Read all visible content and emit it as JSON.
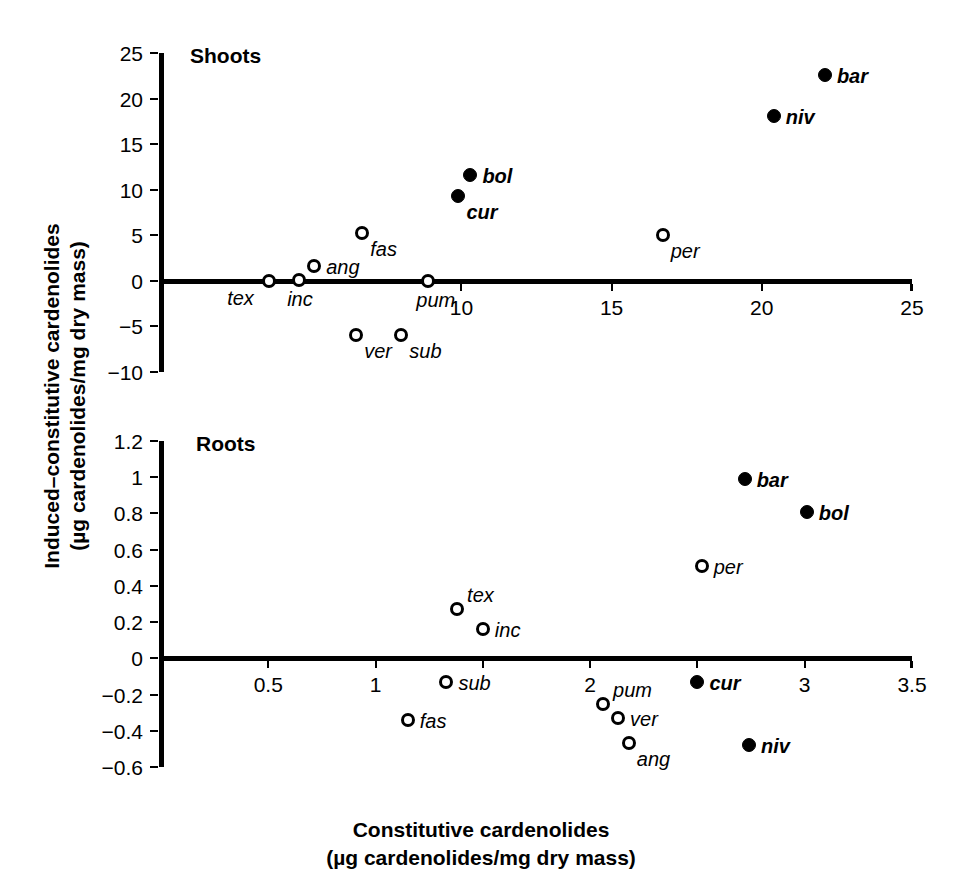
{
  "figure": {
    "xlabel_line1": "Constitutive cardenolides",
    "xlabel_line2": "(µg cardenolides/mg dry mass)",
    "ylabel_line1": "Induced–constitutive cardenolides",
    "ylabel_line2": "(µg cardenolides/mg dry mass)"
  },
  "chart_data": [
    {
      "type": "scatter",
      "title": "Shoots",
      "xlabel": "Constitutive cardenolides (µg cardenolides/mg dry mass)",
      "ylabel": "Induced–constitutive cardenolides (µg cardenolides/mg dry mass)",
      "xlim": [
        0,
        25
      ],
      "ylim": [
        -10,
        25
      ],
      "xticks": [
        10,
        15,
        20,
        25
      ],
      "xticklabels": [
        "10",
        "15",
        "20",
        "25"
      ],
      "yticks": [
        -10,
        -5,
        0,
        5,
        10,
        15,
        20,
        25
      ],
      "yticklabels": [
        "−10",
        "−5",
        "0",
        "5",
        "10",
        "15",
        "20",
        "25"
      ],
      "grid": false,
      "legend": "none",
      "points": [
        {
          "label": "tex",
          "x": 3.6,
          "y": 0.0,
          "fill": "open",
          "label_pos": "below-left"
        },
        {
          "label": "inc",
          "x": 4.6,
          "y": 0.1,
          "fill": "open",
          "label_pos": "below"
        },
        {
          "label": "ang",
          "x": 5.1,
          "y": 1.6,
          "fill": "open",
          "label_pos": "right"
        },
        {
          "label": "fas",
          "x": 6.7,
          "y": 5.3,
          "fill": "open",
          "label_pos": "below-right"
        },
        {
          "label": "pum",
          "x": 8.9,
          "y": 0.0,
          "fill": "open",
          "label_pos": "below"
        },
        {
          "label": "ver",
          "x": 6.5,
          "y": -5.9,
          "fill": "open",
          "label_pos": "below-right"
        },
        {
          "label": "sub",
          "x": 8.0,
          "y": -5.9,
          "fill": "open",
          "label_pos": "below-right"
        },
        {
          "label": "cur",
          "x": 9.9,
          "y": 9.3,
          "fill": "filled",
          "label_pos": "below-right"
        },
        {
          "label": "bol",
          "x": 10.3,
          "y": 11.6,
          "fill": "filled",
          "label_pos": "right"
        },
        {
          "label": "per",
          "x": 16.7,
          "y": 5.0,
          "fill": "open",
          "label_pos": "below-right"
        },
        {
          "label": "niv",
          "x": 20.4,
          "y": 18.1,
          "fill": "filled",
          "label_pos": "right"
        },
        {
          "label": "bar",
          "x": 22.1,
          "y": 22.6,
          "fill": "filled",
          "label_pos": "right"
        }
      ]
    },
    {
      "type": "scatter",
      "title": "Roots",
      "xlabel": "Constitutive cardenolides (µg cardenolides/mg dry mass)",
      "ylabel": "Induced–constitutive cardenolides (µg cardenolides/mg dry mass)",
      "xlim": [
        0,
        3.5
      ],
      "ylim": [
        -0.6,
        1.2
      ],
      "xticks": [
        0.5,
        1,
        1.5,
        2,
        2.5,
        3,
        3.5
      ],
      "xticklabels": [
        "0.5",
        "1",
        "",
        "2",
        "",
        "3",
        "3.5"
      ],
      "yticks": [
        -0.6,
        -0.4,
        -0.2,
        0,
        0.2,
        0.4,
        0.6,
        0.8,
        1,
        1.2
      ],
      "yticklabels": [
        "−0.6",
        "−0.4",
        "−0.2",
        "0",
        "0.2",
        "0.4",
        "0.6",
        "0.8",
        "1",
        "1.2"
      ],
      "grid": false,
      "legend": "none",
      "points": [
        {
          "label": "tex",
          "x": 1.38,
          "y": 0.27,
          "fill": "open",
          "label_pos": "upper-right"
        },
        {
          "label": "inc",
          "x": 1.5,
          "y": 0.16,
          "fill": "open",
          "label_pos": "right"
        },
        {
          "label": "sub",
          "x": 1.33,
          "y": -0.13,
          "fill": "open",
          "label_pos": "right"
        },
        {
          "label": "fas",
          "x": 1.15,
          "y": -0.34,
          "fill": "open",
          "label_pos": "right"
        },
        {
          "label": "pum",
          "x": 2.06,
          "y": -0.25,
          "fill": "open",
          "label_pos": "upper-right"
        },
        {
          "label": "ver",
          "x": 2.13,
          "y": -0.33,
          "fill": "open",
          "label_pos": "right"
        },
        {
          "label": "ang",
          "x": 2.18,
          "y": -0.47,
          "fill": "open",
          "label_pos": "below-right"
        },
        {
          "label": "per",
          "x": 2.52,
          "y": 0.51,
          "fill": "open",
          "label_pos": "right"
        },
        {
          "label": "cur",
          "x": 2.5,
          "y": -0.13,
          "fill": "filled",
          "label_pos": "right"
        },
        {
          "label": "niv",
          "x": 2.74,
          "y": -0.48,
          "fill": "filled",
          "label_pos": "right"
        },
        {
          "label": "bar",
          "x": 2.72,
          "y": 0.99,
          "fill": "filled",
          "label_pos": "right"
        },
        {
          "label": "bol",
          "x": 3.01,
          "y": 0.81,
          "fill": "filled",
          "label_pos": "right"
        }
      ]
    }
  ]
}
